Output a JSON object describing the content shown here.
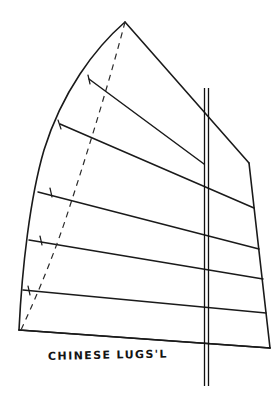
{
  "figure": {
    "caption": "CHINESE LUGS'L",
    "medium": "hand-drawn-pen-sketch",
    "background_color": "#ffffff",
    "ink_color": "#1a1a1a"
  },
  "drawing": {
    "canvas": {
      "width": 279,
      "height": 398
    },
    "sail_outline": {
      "name": "sail-panel-outline",
      "points": "125,22 52,107 27,190 19,330 270,348 249,163",
      "description": "curved-luff six-panel junk sail planform"
    },
    "luff_curve": {
      "name": "luff-leading-edge",
      "path": "M125,22 C95,48 62,92 44,150 C30,198 22,268 19,330"
    },
    "head_edge": {
      "name": "head-upper-leech",
      "path": "M125,22 L249,163"
    },
    "leech_edge": {
      "name": "leech-trailing-edge",
      "path": "M249,163 L270,348"
    },
    "foot_edge": {
      "name": "foot-lower-edge",
      "path": "M19,330 L270,348"
    },
    "battens": [
      {
        "name": "batten-1",
        "path": "M89,79 L204,164",
        "panel": "top"
      },
      {
        "name": "batten-2",
        "path": "M60,124 L254,208"
      },
      {
        "name": "batten-3",
        "path": "M38,192 L259,249"
      },
      {
        "name": "batten-4",
        "path": "M29,240 L263,279"
      },
      {
        "name": "batten-5",
        "path": "M23,290 L266,313"
      },
      {
        "name": "batten-6",
        "path": "M19,330 L270,348",
        "panel": "foot"
      }
    ],
    "guide_line": {
      "name": "peak-to-tack-dashed-guide",
      "path": "M125,22 C112,72 90,145 66,218 C50,266 32,306 21,330",
      "style": "dashed"
    },
    "mast": {
      "name": "mast-spar",
      "top_y": 88,
      "bottom_y": 386,
      "left_x": 204.5,
      "right_x": 208.5,
      "style": "double-line-vertical"
    },
    "tick_marks": [
      {
        "name": "batten-guide-tick-1",
        "path": "M88,75 L90,84"
      },
      {
        "name": "batten-guide-tick-2",
        "path": "M58,120 L61,129"
      },
      {
        "name": "batten-guide-tick-3",
        "path": "M50,188 L52,197"
      },
      {
        "name": "batten-guide-tick-4",
        "path": "M40,236 L42,245"
      },
      {
        "name": "batten-guide-tick-5",
        "path": "M28,286 L30,295"
      }
    ]
  }
}
